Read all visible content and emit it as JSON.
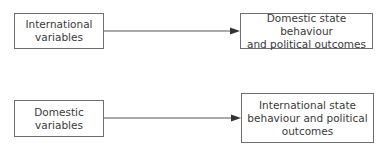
{
  "diagram": {
    "rows": [
      {
        "source": {
          "label": "International\nvariables"
        },
        "target": {
          "label": "Domestic state behaviour\nand political outcomes"
        }
      },
      {
        "source": {
          "label": "Domestic\nvariables"
        },
        "target": {
          "label": "International state\nbehaviour and political\noutcomes"
        }
      }
    ],
    "colors": {
      "line": "#555555",
      "border": "#6e6e6e",
      "text": "#3a3a3a"
    }
  }
}
